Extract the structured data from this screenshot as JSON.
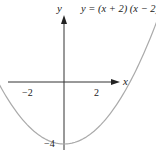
{
  "chart_data": {
    "type": "line",
    "title": "y = (x + 2) (x − 2)",
    "xlabel": "x",
    "ylabel": "y",
    "xlim": [
      -2.8,
      1.65
    ],
    "ylim": [
      -4.3,
      4.0
    ],
    "grid": false,
    "legend": null,
    "x_ticks": [
      -2,
      2
    ],
    "x_tick_labels": [
      "−2",
      "2"
    ],
    "y_ticks": [
      -4
    ],
    "y_tick_labels": [
      "−4"
    ],
    "series": [
      {
        "name": "y = (x + 2)(x − 2)",
        "color": "#aaaaaa",
        "x": [
          -2.9,
          -2.5,
          -2,
          -1.5,
          -1,
          -0.5,
          0,
          0.5,
          1,
          1.5,
          2,
          2.5,
          2.9
        ],
        "y": [
          4.41,
          2.25,
          0,
          -1.75,
          -3,
          -3.75,
          -4,
          -3.75,
          -3,
          -1.75,
          0,
          2.25,
          4.41
        ]
      }
    ],
    "annotations": [
      {
        "text": "−2",
        "x": -2,
        "y": 0
      },
      {
        "text": "2",
        "x": 2,
        "y": 0
      },
      {
        "text": "−4",
        "x": 0,
        "y": -4
      }
    ]
  },
  "labels": {
    "equation": "y = (x + 2) (x − 2)",
    "x_axis": "x",
    "y_axis": "y",
    "tick_neg2": "−2",
    "tick_pos2": "2",
    "tick_neg4": "−4"
  },
  "colors": {
    "axis": "#333333",
    "curve": "#aaaaaa",
    "text": "#222222"
  }
}
